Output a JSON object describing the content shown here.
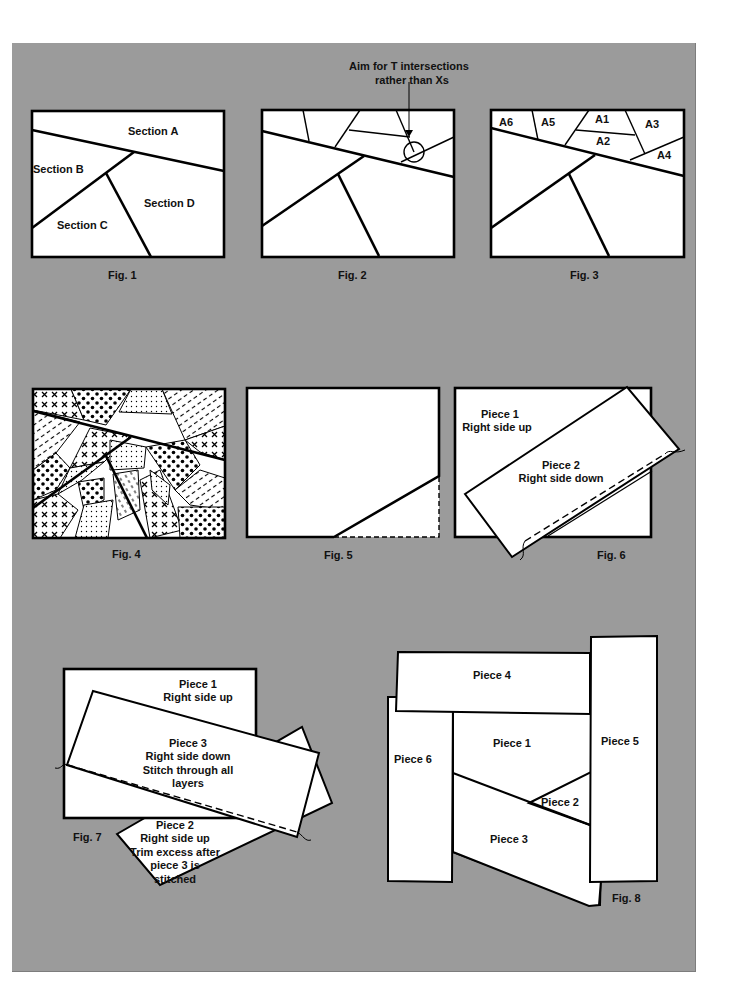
{
  "page": {
    "background": "#ffffff",
    "panel_color": "#9b9b9b"
  },
  "figures": {
    "fig1": {
      "caption": "Fig. 1",
      "sections": [
        "Section A",
        "Section B",
        "Section C",
        "Section D"
      ]
    },
    "fig2": {
      "caption": "Fig. 2",
      "callout_line1": "Aim for T intersections",
      "callout_line2": "rather than Xs"
    },
    "fig3": {
      "caption": "Fig. 3",
      "sub_sections": [
        "A1",
        "A2",
        "A3",
        "A4",
        "A5",
        "A6"
      ]
    },
    "fig4": {
      "caption": "Fig. 4"
    },
    "fig5": {
      "caption": "Fig. 5"
    },
    "fig6": {
      "caption": "Fig. 6",
      "piece1_name": "Piece 1",
      "piece1_note": "Right side up",
      "piece2_name": "Piece 2",
      "piece2_note": "Right side down"
    },
    "fig7": {
      "caption": "Fig. 7",
      "piece1_name": "Piece 1",
      "piece1_note": "Right side up",
      "piece3_name": "Piece 3",
      "piece3_note1": "Right side down",
      "piece3_note2": "Stitch through all",
      "piece3_note3": "layers",
      "piece2_name": "Piece 2",
      "piece2_note1": "Right side up",
      "piece2_note2": "Trim excess after",
      "piece2_note3": "piece 3 is",
      "piece2_note4": "stitched"
    },
    "fig8": {
      "caption": "Fig. 8",
      "pieces": [
        "Piece 1",
        "Piece 2",
        "Piece 3",
        "Piece 4",
        "Piece 5",
        "Piece 6"
      ]
    }
  }
}
